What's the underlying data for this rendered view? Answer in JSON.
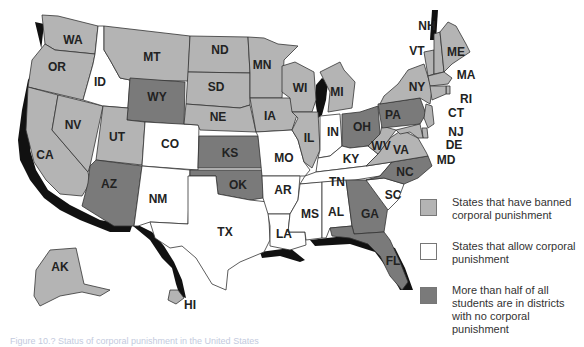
{
  "colors": {
    "banned": "#b4b4b4",
    "allowed": "#ffffff",
    "majority_no_cp": "#7a7a7a",
    "water": "#111111",
    "border": "#333333"
  },
  "legend": [
    {
      "key": "banned",
      "label": "States that have banned corporal punishment"
    },
    {
      "key": "allowed",
      "label": "States that allow corporal punishment"
    },
    {
      "key": "majority_no_cp",
      "label": "More than half of all students are in districts with no corporal punishment"
    }
  ],
  "states": {
    "WA": "banned",
    "OR": "banned",
    "CA": "banned",
    "NV": "banned",
    "ID": "allowed",
    "MT": "banned",
    "WY": "majority_no_cp",
    "UT": "banned",
    "CO": "allowed",
    "AZ": "majority_no_cp",
    "NM": "allowed",
    "ND": "banned",
    "SD": "banned",
    "NE": "banned",
    "KS": "majority_no_cp",
    "OK": "majority_no_cp",
    "TX": "allowed",
    "MN": "banned",
    "IA": "banned",
    "MO": "allowed",
    "AR": "allowed",
    "LA": "allowed",
    "WI": "banned",
    "IL": "banned",
    "MI": "banned",
    "IN": "allowed",
    "OH": "majority_no_cp",
    "KY": "allowed",
    "TN": "allowed",
    "MS": "allowed",
    "AL": "allowed",
    "GA": "majority_no_cp",
    "FL": "majority_no_cp",
    "SC": "allowed",
    "NC": "majority_no_cp",
    "VA": "banned",
    "WV": "banned",
    "PA": "majority_no_cp",
    "NY": "banned",
    "VT": "banned",
    "NH": "banned",
    "ME": "banned",
    "MA": "banned",
    "RI": "banned",
    "CT": "banned",
    "NJ": "banned",
    "DE": "banned",
    "MD": "banned",
    "AK": "banned",
    "HI": "banned"
  },
  "labels": [
    {
      "code": "WA",
      "x": 73,
      "y": 40
    },
    {
      "code": "OR",
      "x": 57,
      "y": 67
    },
    {
      "code": "CA",
      "x": 45,
      "y": 155
    },
    {
      "code": "NV",
      "x": 73,
      "y": 125
    },
    {
      "code": "ID",
      "x": 100,
      "y": 82
    },
    {
      "code": "MT",
      "x": 152,
      "y": 57
    },
    {
      "code": "WY",
      "x": 157,
      "y": 97
    },
    {
      "code": "UT",
      "x": 117,
      "y": 137
    },
    {
      "code": "CO",
      "x": 170,
      "y": 144
    },
    {
      "code": "AZ",
      "x": 109,
      "y": 184
    },
    {
      "code": "NM",
      "x": 158,
      "y": 199
    },
    {
      "code": "ND",
      "x": 220,
      "y": 50
    },
    {
      "code": "SD",
      "x": 216,
      "y": 87
    },
    {
      "code": "NE",
      "x": 218,
      "y": 117
    },
    {
      "code": "KS",
      "x": 230,
      "y": 153
    },
    {
      "code": "OK",
      "x": 238,
      "y": 185
    },
    {
      "code": "TX",
      "x": 225,
      "y": 232
    },
    {
      "code": "MN",
      "x": 262,
      "y": 65
    },
    {
      "code": "IA",
      "x": 270,
      "y": 116
    },
    {
      "code": "MO",
      "x": 284,
      "y": 158
    },
    {
      "code": "AR",
      "x": 283,
      "y": 190
    },
    {
      "code": "LA",
      "x": 284,
      "y": 234
    },
    {
      "code": "WI",
      "x": 300,
      "y": 88
    },
    {
      "code": "IL",
      "x": 309,
      "y": 138
    },
    {
      "code": "MI",
      "x": 337,
      "y": 92
    },
    {
      "code": "IN",
      "x": 333,
      "y": 132
    },
    {
      "code": "OH",
      "x": 362,
      "y": 127
    },
    {
      "code": "KY",
      "x": 351,
      "y": 159
    },
    {
      "code": "TN",
      "x": 337,
      "y": 182
    },
    {
      "code": "MS",
      "x": 310,
      "y": 214
    },
    {
      "code": "AL",
      "x": 336,
      "y": 212
    },
    {
      "code": "GA",
      "x": 370,
      "y": 214
    },
    {
      "code": "FL",
      "x": 393,
      "y": 261
    },
    {
      "code": "SC",
      "x": 393,
      "y": 195
    },
    {
      "code": "NC",
      "x": 405,
      "y": 172
    },
    {
      "code": "VA",
      "x": 401,
      "y": 150
    },
    {
      "code": "WV",
      "x": 381,
      "y": 146
    },
    {
      "code": "PA",
      "x": 393,
      "y": 115
    },
    {
      "code": "NY",
      "x": 417,
      "y": 87
    },
    {
      "code": "VT",
      "x": 417,
      "y": 51
    },
    {
      "code": "NH",
      "x": 427,
      "y": 26
    },
    {
      "code": "ME",
      "x": 456,
      "y": 52
    },
    {
      "code": "MA",
      "x": 466,
      "y": 75
    },
    {
      "code": "RI",
      "x": 466,
      "y": 99
    },
    {
      "code": "CT",
      "x": 456,
      "y": 113
    },
    {
      "code": "NJ",
      "x": 456,
      "y": 132
    },
    {
      "code": "DE",
      "x": 454,
      "y": 145
    },
    {
      "code": "MD",
      "x": 446,
      "y": 160
    },
    {
      "code": "AK",
      "x": 60,
      "y": 267
    },
    {
      "code": "HI",
      "x": 190,
      "y": 305
    }
  ],
  "caption": "Figure 10.? Status of corporal punishment in the United States"
}
